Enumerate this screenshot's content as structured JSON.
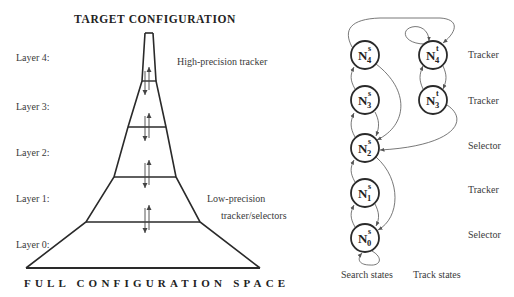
{
  "left_diagram": {
    "top_title": "TARGET CONFIGURATION",
    "bottom_title": "FULL CONFIGURATION SPACE",
    "layers": [
      {
        "label": "Layer 4:"
      },
      {
        "label": "Layer 3:"
      },
      {
        "label": "Layer 2:"
      },
      {
        "label": "Layer 1:"
      },
      {
        "label": "Layer 0:"
      }
    ],
    "annotations": {
      "high": "High-precision tracker",
      "low_line1": "Low-precision",
      "low_line2": "tracker/selectors"
    }
  },
  "right_diagram": {
    "nodes": [
      {
        "id": "N4s",
        "base": "N",
        "sup": "s",
        "sub": "4"
      },
      {
        "id": "N3s",
        "base": "N",
        "sup": "s",
        "sub": "3"
      },
      {
        "id": "N2s",
        "base": "N",
        "sup": "s",
        "sub": "2"
      },
      {
        "id": "N1s",
        "base": "N",
        "sup": "s",
        "sub": "1"
      },
      {
        "id": "N0s",
        "base": "N",
        "sup": "s",
        "sub": "0"
      },
      {
        "id": "N4t",
        "base": "N",
        "sup": "t",
        "sub": "4"
      },
      {
        "id": "N3t",
        "base": "N",
        "sup": "t",
        "sub": "3"
      }
    ],
    "roles": [
      "Tracker",
      "Tracker",
      "Selector",
      "Tracker",
      "Selector"
    ],
    "column_labels": {
      "search": "Search states",
      "track": "Track states"
    }
  },
  "colors": {
    "line": "#2a2a2a",
    "thin_line": "#555555",
    "text": "#3a3a3a",
    "background": "#ffffff"
  }
}
